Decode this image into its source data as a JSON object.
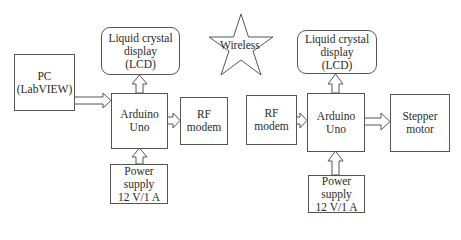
{
  "diagram": {
    "left_system": {
      "pc": {
        "line1": "PC",
        "line2": "(LabVIEW)"
      },
      "lcd": {
        "line1": "Liquid crystal",
        "line2": "display",
        "line3": "(LCD)"
      },
      "arduino": {
        "line1": "Arduino",
        "line2": "Uno"
      },
      "rf_modem": {
        "line1": "RF",
        "line2": "modem"
      },
      "power": {
        "line1": "Power",
        "line2": "supply",
        "line3": "12 V/1 A"
      }
    },
    "wireless": {
      "label": "Wireless"
    },
    "right_system": {
      "lcd": {
        "line1": "Liquid crystal",
        "line2": "display",
        "line3": "(LCD)"
      },
      "rf_modem": {
        "line1": "RF",
        "line2": "modem"
      },
      "arduino": {
        "line1": "Arduino",
        "line2": "Uno"
      },
      "stepper": {
        "line1": "Stepper",
        "line2": "motor"
      },
      "power": {
        "line1": "Power",
        "line2": "supply",
        "line3": "12 V/1 A"
      }
    },
    "colors": {
      "stroke": "#555555",
      "text": "#2a2a2a",
      "background": "#ffffff"
    }
  }
}
